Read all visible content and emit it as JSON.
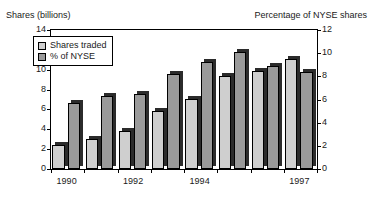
{
  "chart_data": {
    "type": "bar",
    "title": "",
    "subtitle": "",
    "left_axis_title": "Shares (billions)",
    "right_axis_title": "Percentage of NYSE shares",
    "xlabel": "",
    "grid": false,
    "legend_position": "top-left",
    "categories": [
      "1990",
      "1991",
      "1992",
      "1993",
      "1994",
      "1995",
      "1996",
      "1997"
    ],
    "visible_tick_labels": [
      "1990",
      "1992",
      "1994",
      "1997"
    ],
    "left_ylim": [
      0,
      14
    ],
    "right_ylim": [
      0,
      12
    ],
    "left_ticks": [
      "14",
      "12",
      "10",
      "8",
      "6",
      "4",
      "2",
      "0"
    ],
    "right_ticks": [
      "12",
      "10",
      "8",
      "6",
      "4",
      "2",
      "0"
    ],
    "series": [
      {
        "name": "Shares traded",
        "axis": "left",
        "unit": "billions",
        "color": "#cfcfcf",
        "values": [
          2.4,
          3.0,
          3.8,
          5.8,
          7.1,
          9.4,
          9.9,
          11.1
        ]
      },
      {
        "name": "% of NYSE",
        "axis": "right",
        "unit": "percent",
        "color": "#9a9a9a",
        "values": [
          5.7,
          6.3,
          6.5,
          8.2,
          9.2,
          10.1,
          8.9,
          8.4
        ]
      }
    ]
  },
  "legend": {
    "items": [
      {
        "label": "Shares traded",
        "swatch": "light"
      },
      {
        "label": "% of NYSE",
        "swatch": "dark"
      }
    ]
  }
}
